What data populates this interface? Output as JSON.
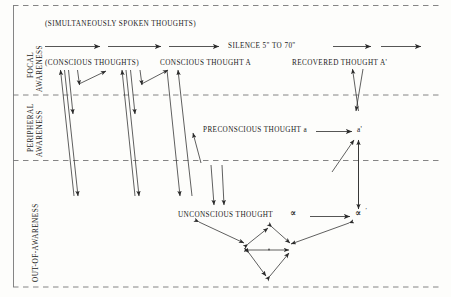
{
  "figure": {
    "title_text": "(SIMULTANEOUSLY SPOKEN THOUGHTS)",
    "bands": [
      {
        "id": "focal",
        "label_line1": "FOCAL",
        "label_line2": "AWARENESS"
      },
      {
        "id": "peripheral",
        "label_line1": "PERIPHERAL",
        "label_line2": "AWARENESS"
      },
      {
        "id": "unaware",
        "label_line1": "OUT-OF-AWARENESS",
        "label_line2": ""
      }
    ],
    "labels": {
      "simultaneous": "(SIMULTANEOUSLY SPOKEN THOUGHTS)",
      "silence": "SILENCE 5\" TO 70\"",
      "conscious_thoughts": "(CONSCIOUS THOUGHTS)",
      "conscious_thought_a": "CONSCIOUS THOUGHT A",
      "recovered_thought": "RECOVERED THOUGHT A'",
      "preconscious_thought": "PRECONSCIOUS THOUGHT a",
      "preconscious_prime": "a'",
      "unconscious_thought": "UNCONSCIOUS THOUGHT",
      "unconscious_alpha": "∝",
      "unconscious_alpha_prime": "∝",
      "unconscious_alpha_prime_mark": "'"
    },
    "colors": {
      "ink": "#1a1a1a",
      "rule": "#6f6f6f",
      "background": "#fdfdfb"
    }
  }
}
